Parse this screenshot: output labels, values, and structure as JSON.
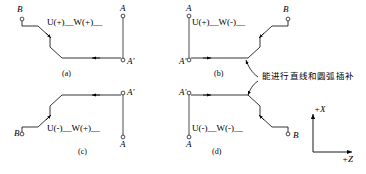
{
  "figure": {
    "title": "",
    "annotation": {
      "text": "能进行直线和圆弧插补",
      "name": "interpolation-note"
    },
    "axes": {
      "x_label": "+X",
      "z_label": "+Z"
    },
    "quadrants": [
      {
        "id": "a",
        "caption": "(a)",
        "formula": "U(+)__W(+)__",
        "start_label": "B",
        "end_label": "A",
        "end_label_prime": "A'"
      },
      {
        "id": "b",
        "caption": "(b)",
        "formula": "U(+)__W(-)__",
        "start_label": "B",
        "end_label": "A",
        "end_label_prime": "A'"
      },
      {
        "id": "c",
        "caption": "(c)",
        "formula": "U(-)__W(+)__",
        "start_label": "B",
        "end_label": "A",
        "end_label_prime": "A'"
      },
      {
        "id": "d",
        "caption": "(d)",
        "formula": "U(-)__W(-)__",
        "start_label": "B",
        "end_label": "A",
        "end_label_prime": "A'"
      }
    ],
    "colors": {
      "line": "#000000",
      "background": "#ffffff"
    }
  }
}
